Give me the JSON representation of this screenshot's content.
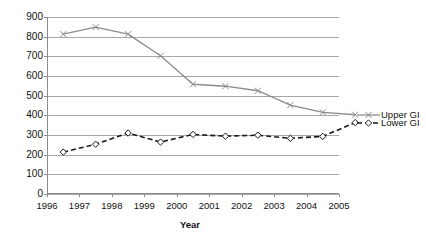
{
  "chart_data": {
    "type": "line",
    "title": "",
    "xlabel": "Year",
    "ylabel": "",
    "x": [
      1996,
      1997,
      1998,
      1999,
      2000,
      2001,
      2002,
      2003,
      2004,
      2005
    ],
    "categories": [
      "1996",
      "1997",
      "1998",
      "1999",
      "2000",
      "2001",
      "2002",
      "2003",
      "2004",
      "2005"
    ],
    "xlim": [
      1996,
      2005
    ],
    "ylim": [
      0,
      900
    ],
    "yticks": [
      0,
      100,
      200,
      300,
      400,
      500,
      600,
      700,
      800,
      900
    ],
    "ytick_labels": [
      "0",
      "100",
      "200",
      "300",
      "400",
      "500",
      "600",
      "700",
      "800",
      "900"
    ],
    "grid": "horizontal",
    "legend_position": "right",
    "series": [
      {
        "name": "Upper GI",
        "color": "#8c8c8c",
        "line_style": "solid",
        "marker": "x",
        "values": [
          813,
          848,
          813,
          703,
          558,
          548,
          525,
          452,
          415,
          403
        ]
      },
      {
        "name": "Lower GI",
        "color": "#1a1a1a",
        "line_style": "dashed",
        "marker": "diamond",
        "values": [
          213,
          253,
          310,
          264,
          303,
          294,
          299,
          283,
          293,
          363
        ]
      }
    ]
  },
  "axis": {
    "x_title": "Year",
    "x_tick_labels": [
      "1996",
      "1997",
      "1998",
      "1999",
      "2000",
      "2001",
      "2002",
      "2003",
      "2004",
      "2005"
    ],
    "y_tick_labels": [
      "900",
      "800",
      "700",
      "600",
      "500",
      "400",
      "300",
      "200",
      "100",
      "0"
    ]
  },
  "legend": {
    "items": [
      {
        "label": "Upper GI",
        "color": "#8c8c8c",
        "style": "solid",
        "marker": "x"
      },
      {
        "label": "Lower GI",
        "color": "#1a1a1a",
        "style": "dashed",
        "marker": "diamond"
      }
    ]
  },
  "colors": {
    "upper_gi": "#8c8c8c",
    "lower_gi": "#1a1a1a",
    "gridline": "#a8a8a8",
    "axis": "#8c8c8c",
    "background": "#ffffff"
  }
}
